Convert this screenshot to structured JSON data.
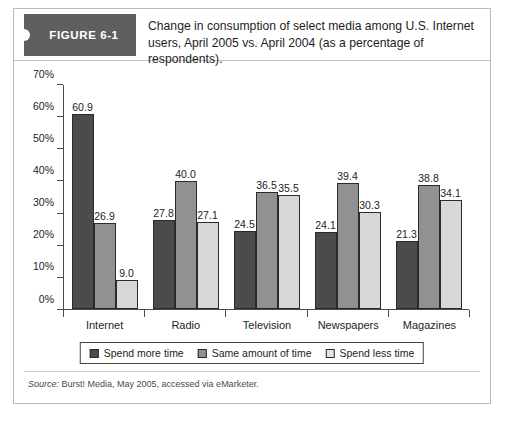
{
  "figure": {
    "badge_label": "FIGURE 6-1",
    "title": "Change in consumption of select media among U.S. Internet users, April 2005 vs. April 2004 (as a percentage of respondents).",
    "source_prefix": "Source:",
    "source_text": "Burst! Media, May 2005, accessed via eMarketer."
  },
  "colors": {
    "badge_bg": "#5f5f5f",
    "series_0": "#4b4b4b",
    "series_1": "#919191",
    "series_2": "#d7d7d7",
    "axis": "#4a4a4a",
    "card_border": "#b9b9b9"
  },
  "chart_data": {
    "type": "bar",
    "title": "Change in consumption of select media among U.S. Internet users, April 2005 vs. April 2004 (as a percentage of respondents).",
    "xlabel": "",
    "ylabel": "",
    "ylim": [
      0,
      70
    ],
    "yticks": [
      "0%",
      "10%",
      "20%",
      "30%",
      "40%",
      "50%",
      "60%",
      "70%"
    ],
    "ytick_values": [
      0,
      10,
      20,
      30,
      40,
      50,
      60,
      70
    ],
    "grid": false,
    "legend_position": "bottom",
    "categories": [
      "Internet",
      "Radio",
      "Television",
      "Newspapers",
      "Magazines"
    ],
    "series": [
      {
        "name": "Spend more time",
        "values": [
          60.9,
          27.8,
          24.5,
          24.1,
          21.3
        ],
        "labels": [
          "60.9",
          "27.8",
          "24.5",
          "24.1",
          "21.3"
        ]
      },
      {
        "name": "Same amount of time",
        "values": [
          26.9,
          40.0,
          36.5,
          39.4,
          38.8
        ],
        "labels": [
          "26.9",
          "40.0",
          "36.5",
          "39.4",
          "38.8"
        ]
      },
      {
        "name": "Spend less time",
        "values": [
          9.0,
          27.1,
          35.5,
          30.3,
          34.1
        ],
        "labels": [
          "9.0",
          "27.1",
          "35.5",
          "30.3",
          "34.1"
        ]
      }
    ]
  }
}
